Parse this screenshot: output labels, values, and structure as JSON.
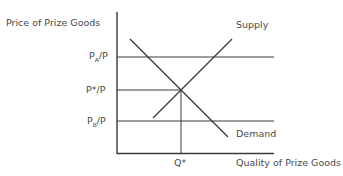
{
  "diagram": {
    "y_axis_label": "Price of Prize Goods",
    "x_axis_label": "Quality of Prize Goods",
    "price_labels": {
      "pa": {
        "main": "P",
        "sub": "A",
        "rest": "/P"
      },
      "pstar": {
        "main": "P*/P"
      },
      "pb": {
        "main": "P",
        "sub": "B",
        "rest": "/P"
      }
    },
    "quantity_label": "Q*",
    "curves": {
      "supply": "Supply",
      "demand": "Demand"
    },
    "colors": {
      "line": "#3a3a3a",
      "text": "#4a4a4a"
    }
  }
}
